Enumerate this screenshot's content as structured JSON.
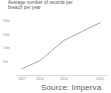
{
  "figure": {
    "title": "Average number of records per\nbreach per year",
    "source_caption": "Source: Imperva",
    "background_color": "#ffffff",
    "line_color": "#9a9a9a",
    "axis_color": "#c9c9c9",
    "tick_text_color": "#8a8a8a",
    "title_text_color": "#555555"
  },
  "chart_data": {
    "type": "line",
    "title": "Average number of records per breach per year",
    "xlabel": "",
    "ylabel": "",
    "grid": false,
    "legend": null,
    "x": [
      2007,
      2010,
      2014,
      2020
    ],
    "categories": [
      "2007",
      "2010",
      "2014",
      "2020"
    ],
    "xtick_labels": [
      "2007",
      "2010",
      "2014",
      "2020"
    ],
    "ytick_labels": [
      "20m",
      "15m",
      "10m",
      "5m"
    ],
    "ytick_values": [
      20,
      15,
      10,
      5
    ],
    "ylim": [
      0,
      22
    ],
    "xlim": [
      2006,
      2021
    ],
    "yunit": "millions of records",
    "series": [
      {
        "name": "Average records per breach",
        "values": [
          2.5,
          5.5,
          13.0,
          19.5
        ],
        "points": [
          {
            "x": 2007,
            "y": 2.5
          },
          {
            "x": 2010,
            "y": 5.5
          },
          {
            "x": 2014,
            "y": 13.0
          },
          {
            "x": 2020,
            "y": 19.5
          }
        ]
      }
    ]
  }
}
